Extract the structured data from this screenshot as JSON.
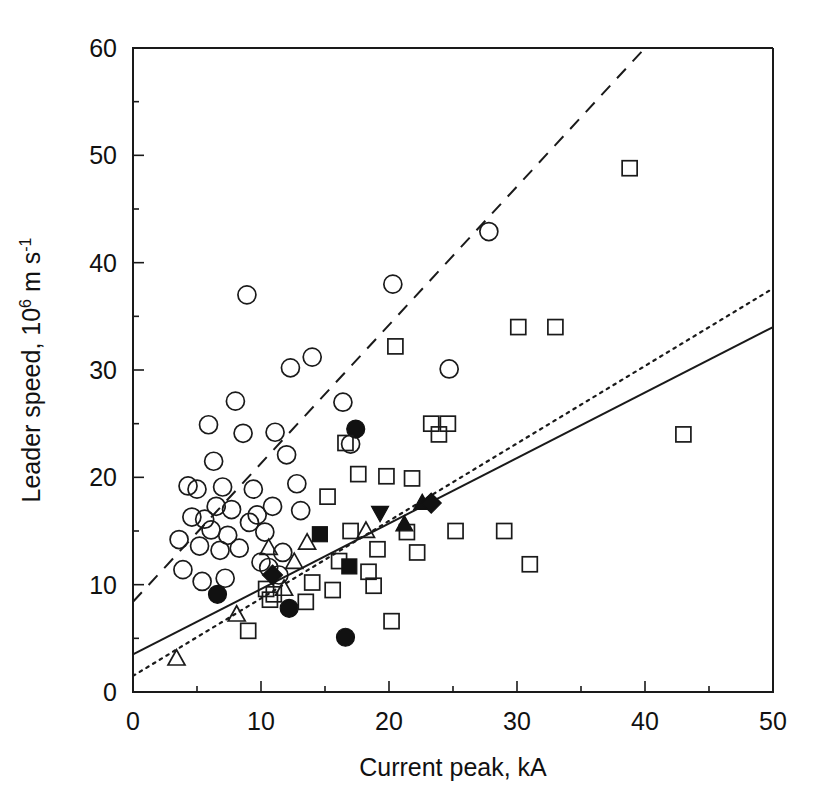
{
  "figure": {
    "title": "",
    "background": "#ffffff",
    "ink_color": "#111111"
  },
  "axes": {
    "x_title": "Current peak, kA",
    "y_title_main": "Leader speed, 10",
    "y_title_exp": "6",
    "y_title_tail": " m s",
    "y_title_tail_exp": "-1",
    "x_ticks": [
      "0",
      "10",
      "20",
      "30",
      "40",
      "50"
    ],
    "y_ticks": [
      "0",
      "10",
      "20",
      "30",
      "40",
      "50",
      "60"
    ]
  },
  "chart_data": {
    "type": "scatter",
    "title": "",
    "xlabel": "Current peak, kA",
    "ylabel": "Leader speed, 10^6 m s^-1",
    "xlim": [
      0,
      50
    ],
    "ylim": [
      0,
      60
    ],
    "xticks": [
      0,
      10,
      20,
      30,
      40,
      50
    ],
    "yticks": [
      0,
      10,
      20,
      30,
      40,
      50,
      60
    ],
    "grid": false,
    "legend": "none",
    "series": [
      {
        "name": "open-circle",
        "marker": "circle-open",
        "points": [
          [
            3.6,
            14.2
          ],
          [
            3.9,
            11.4
          ],
          [
            4.3,
            19.2
          ],
          [
            4.6,
            16.3
          ],
          [
            5.0,
            18.9
          ],
          [
            5.2,
            13.6
          ],
          [
            5.4,
            10.3
          ],
          [
            5.6,
            16.1
          ],
          [
            5.9,
            24.9
          ],
          [
            6.1,
            15.1
          ],
          [
            6.3,
            21.5
          ],
          [
            6.5,
            17.3
          ],
          [
            6.8,
            13.2
          ],
          [
            7.0,
            19.1
          ],
          [
            7.2,
            10.6
          ],
          [
            7.4,
            14.6
          ],
          [
            7.7,
            17.0
          ],
          [
            8.0,
            27.1
          ],
          [
            8.3,
            13.4
          ],
          [
            8.6,
            24.1
          ],
          [
            8.9,
            37.0
          ],
          [
            9.1,
            15.8
          ],
          [
            9.4,
            18.9
          ],
          [
            9.7,
            16.5
          ],
          [
            10.0,
            12.1
          ],
          [
            10.3,
            14.9
          ],
          [
            10.6,
            11.6
          ],
          [
            10.9,
            17.3
          ],
          [
            11.1,
            24.2
          ],
          [
            11.4,
            10.9
          ],
          [
            11.7,
            13.0
          ],
          [
            12.0,
            22.1
          ],
          [
            12.3,
            30.2
          ],
          [
            12.8,
            19.4
          ],
          [
            13.1,
            16.9
          ],
          [
            14.0,
            31.2
          ],
          [
            16.4,
            27.0
          ],
          [
            17.0,
            23.1
          ],
          [
            20.3,
            38.0
          ],
          [
            24.7,
            30.1
          ],
          [
            27.8,
            42.9
          ]
        ]
      },
      {
        "name": "filled-circle",
        "marker": "circle-filled",
        "points": [
          [
            6.6,
            9.1
          ],
          [
            12.2,
            7.8
          ],
          [
            16.6,
            5.1
          ],
          [
            17.4,
            24.5
          ]
        ]
      },
      {
        "name": "open-square",
        "marker": "square-open",
        "points": [
          [
            9.0,
            5.7
          ],
          [
            10.4,
            9.6
          ],
          [
            10.7,
            8.6
          ],
          [
            11.0,
            9.1
          ],
          [
            13.5,
            8.4
          ],
          [
            14.0,
            10.2
          ],
          [
            15.2,
            18.2
          ],
          [
            15.6,
            9.5
          ],
          [
            16.1,
            12.2
          ],
          [
            16.6,
            23.2
          ],
          [
            17.0,
            15.0
          ],
          [
            17.6,
            20.3
          ],
          [
            18.4,
            11.2
          ],
          [
            18.8,
            9.9
          ],
          [
            19.1,
            13.3
          ],
          [
            19.8,
            20.1
          ],
          [
            20.2,
            6.6
          ],
          [
            20.5,
            32.2
          ],
          [
            21.4,
            14.9
          ],
          [
            21.8,
            19.9
          ],
          [
            22.2,
            13.0
          ],
          [
            23.3,
            25.0
          ],
          [
            23.9,
            24.0
          ],
          [
            24.6,
            25.0
          ],
          [
            25.2,
            15.0
          ],
          [
            29.0,
            15.0
          ],
          [
            30.1,
            34.0
          ],
          [
            31.0,
            11.9
          ],
          [
            33.0,
            34.0
          ],
          [
            38.8,
            48.8
          ],
          [
            43.0,
            24.0
          ]
        ]
      },
      {
        "name": "filled-square",
        "marker": "square-filled",
        "points": [
          [
            14.6,
            14.7
          ],
          [
            16.9,
            11.7
          ]
        ]
      },
      {
        "name": "open-triangle-up",
        "marker": "triangle-open",
        "points": [
          [
            3.4,
            3.1
          ],
          [
            8.1,
            7.2
          ],
          [
            10.6,
            13.4
          ],
          [
            11.8,
            9.6
          ],
          [
            12.6,
            12.1
          ],
          [
            13.6,
            13.9
          ],
          [
            18.2,
            15.0
          ]
        ]
      },
      {
        "name": "filled-triangle-up",
        "marker": "triangle-filled",
        "points": [
          [
            21.2,
            15.6
          ],
          [
            22.6,
            17.6
          ]
        ]
      },
      {
        "name": "filled-triangle-down",
        "marker": "triangle-down-filled",
        "points": [
          [
            19.3,
            16.7
          ]
        ]
      },
      {
        "name": "filled-diamond",
        "marker": "diamond-filled",
        "points": [
          [
            10.9,
            10.9
          ],
          [
            23.3,
            17.6
          ]
        ]
      }
    ],
    "fit_lines": [
      {
        "name": "dashed-fit",
        "style": "dashed",
        "x": [
          0,
          40.0
        ],
        "y": [
          8.4,
          60.0
        ]
      },
      {
        "name": "dotted-fit",
        "style": "dotted",
        "x": [
          0,
          50.0
        ],
        "y": [
          1.5,
          37.6
        ]
      },
      {
        "name": "solid-fit",
        "style": "solid",
        "x": [
          0,
          50.0
        ],
        "y": [
          3.5,
          34.0
        ]
      }
    ]
  }
}
